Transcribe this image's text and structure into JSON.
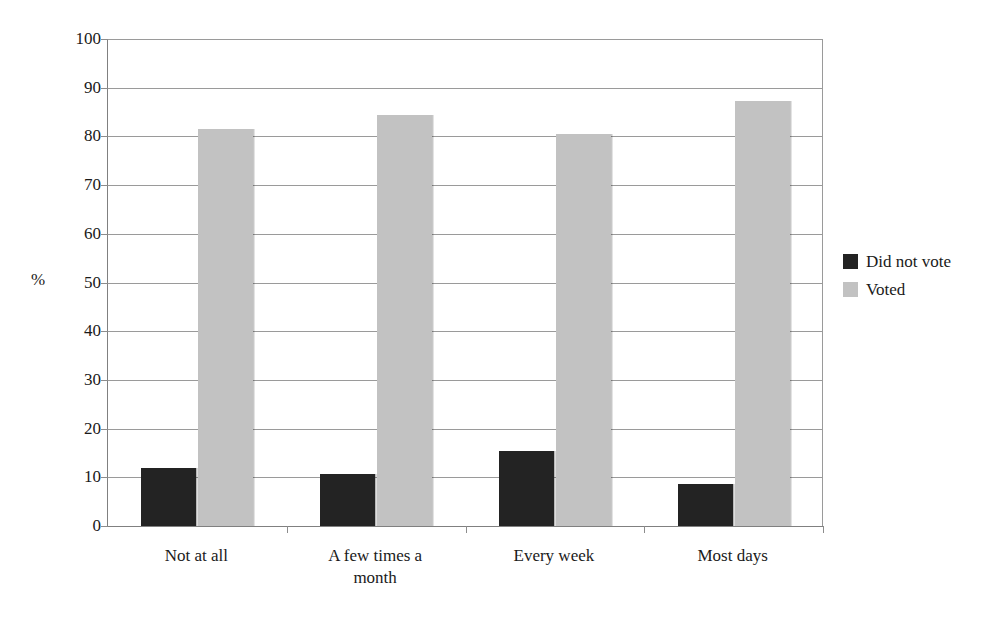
{
  "chart_data": {
    "type": "bar",
    "title": "",
    "xlabel": "",
    "ylabel": "%",
    "ylim": [
      0,
      100
    ],
    "ytick_step": 10,
    "grid": true,
    "legend_position": "right",
    "categories": [
      "Not at all",
      "A few times a month",
      "Every week",
      "Most days"
    ],
    "category_lines": [
      [
        "Not at all"
      ],
      [
        "A few times a",
        "month"
      ],
      [
        "Every week"
      ],
      [
        "Most days"
      ]
    ],
    "ytick_labels": [
      "100",
      "90",
      "80",
      "70",
      "60",
      "50",
      "40",
      "30",
      "20",
      "10",
      "0"
    ],
    "ytick_values": [
      100,
      90,
      80,
      70,
      60,
      50,
      40,
      30,
      20,
      10,
      0
    ],
    "series": [
      {
        "name": "Did not vote",
        "color": "#232323",
        "values": [
          11.9,
          10.7,
          15.5,
          8.7
        ]
      },
      {
        "name": "Voted",
        "color": "#c2c2c2",
        "values": [
          81.6,
          84.3,
          80.5,
          87.3
        ]
      }
    ]
  },
  "legend": {
    "items": [
      {
        "label": "Did not vote",
        "swatch": "dark"
      },
      {
        "label": "Voted",
        "swatch": "light"
      }
    ]
  }
}
